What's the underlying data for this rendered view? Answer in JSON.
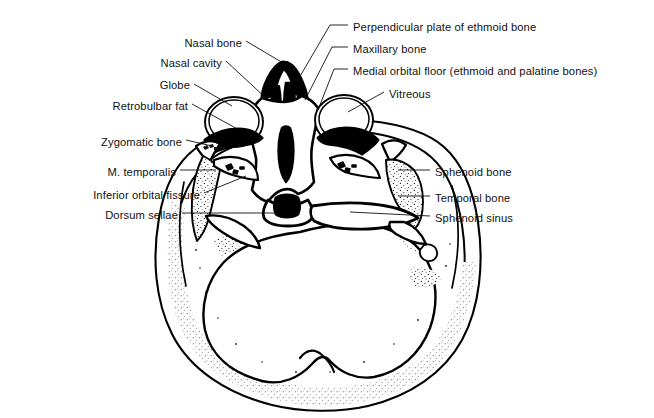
{
  "figure": {
    "modality": "line drawing / anatomical illustration",
    "view": "axial (transverse) section, viewed from below",
    "background_color": "#ffffff",
    "ink_color": "#000000",
    "stipple_color": "#1a1a1a"
  },
  "labels": {
    "left": [
      {
        "id": "nasal-bone",
        "text": "Nasal bone",
        "text_anchor_x": 242,
        "text_y": 44,
        "align": "right",
        "leader": [
          [
            246,
            41
          ],
          [
            283,
            63
          ]
        ]
      },
      {
        "id": "nasal-cavity",
        "text": "Nasal cavity",
        "text_anchor_x": 222,
        "text_y": 64,
        "align": "right",
        "leader": [
          [
            226,
            61
          ],
          [
            268,
            100
          ]
        ]
      },
      {
        "id": "globe",
        "text": "Globe",
        "text_anchor_x": 190,
        "text_y": 86,
        "align": "right",
        "leader": [
          [
            194,
            84
          ],
          [
            232,
            106
          ]
        ]
      },
      {
        "id": "retrobulbar-fat",
        "text": "Retrobulbar fat",
        "text_anchor_x": 188,
        "text_y": 107,
        "align": "right",
        "leader": [
          [
            192,
            104
          ],
          [
            241,
            131
          ]
        ]
      },
      {
        "id": "zygomatic-bone",
        "text": "Zygomatic bone",
        "text_anchor_x": 182,
        "text_y": 143,
        "align": "right",
        "leader": [
          [
            186,
            140
          ],
          [
            212,
            146
          ]
        ]
      },
      {
        "id": "m-temporalis",
        "text": "M. temporalis",
        "text_anchor_x": 176,
        "text_y": 173,
        "align": "right",
        "leader": [
          [
            180,
            170
          ],
          [
            216,
            170
          ]
        ]
      },
      {
        "id": "inferior-orbital-fissure",
        "text": "Inferior orbital fissure",
        "text_anchor_x": 200,
        "text_y": 196,
        "align": "right",
        "leader": [
          [
            204,
            193
          ],
          [
            246,
            176
          ]
        ]
      },
      {
        "id": "dorsum-sellae",
        "text": "Dorsum sellae",
        "text_anchor_x": 178,
        "text_y": 216,
        "align": "right",
        "leader": [
          [
            182,
            213
          ],
          [
            292,
            213
          ]
        ]
      }
    ],
    "right": [
      {
        "id": "perpendicular-plate-ethmoid",
        "text": "Perpendicular plate of ethmoid bone",
        "text_anchor_x": 352,
        "text_y": 28,
        "align": "left",
        "leader": [
          [
            348,
            25
          ],
          [
            330,
            25
          ],
          [
            292,
            90
          ]
        ]
      },
      {
        "id": "maxillary-bone",
        "text": "Maxillary bone",
        "text_anchor_x": 352,
        "text_y": 50,
        "align": "left",
        "leader": [
          [
            348,
            47
          ],
          [
            332,
            47
          ],
          [
            305,
            100
          ]
        ]
      },
      {
        "id": "medial-orbital-floor",
        "text": "Medial orbital floor (ethmoid and palatine bones)",
        "text_anchor_x": 352,
        "text_y": 72,
        "align": "left",
        "leader": [
          [
            348,
            69
          ],
          [
            334,
            69
          ],
          [
            318,
            110
          ]
        ]
      },
      {
        "id": "vitreous",
        "text": "Vitreous",
        "text_anchor_x": 388,
        "text_y": 95,
        "align": "left",
        "leader": [
          [
            384,
            92
          ],
          [
            348,
            112
          ]
        ]
      },
      {
        "id": "sphenoid-bone",
        "text": "Sphenoid bone",
        "text_anchor_x": 434,
        "text_y": 173,
        "align": "left",
        "leader": [
          [
            430,
            170
          ],
          [
            398,
            170
          ]
        ]
      },
      {
        "id": "temporal-bone",
        "text": "Temporal bone",
        "text_anchor_x": 434,
        "text_y": 199,
        "align": "left",
        "leader": [
          [
            430,
            196
          ],
          [
            398,
            196
          ]
        ]
      },
      {
        "id": "sphenoid-sinus",
        "text": "Sphenoid sinus",
        "text_anchor_x": 434,
        "text_y": 219,
        "align": "left",
        "leader": [
          [
            430,
            216
          ],
          [
            350,
            212
          ]
        ]
      }
    ]
  }
}
